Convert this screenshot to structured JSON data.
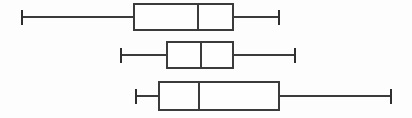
{
  "figure": {
    "background_color": "#fdfdfd",
    "line_color": "#3b3b3b",
    "box_fill_color": "#fefefe",
    "width": 412,
    "height": 118
  },
  "chart_data": {
    "type": "box",
    "orientation": "horizontal",
    "title": "",
    "subtitle": "",
    "xlabel": "",
    "ylabel": "",
    "xlim": [
      0,
      412
    ],
    "ylim": [
      0,
      3
    ],
    "grid": false,
    "legend": null,
    "axes_visible": false,
    "tick_labels": [],
    "categories": [
      "Series 1",
      "Series 2",
      "Series 3"
    ],
    "boxes": [
      {
        "name": "Series 1",
        "row": 1,
        "whisker_low": 22,
        "q1": 134,
        "median": 198,
        "q3": 233,
        "whisker_high": 279,
        "center_y": 17,
        "box_top": 4,
        "box_bottom": 30,
        "cap_top": 10,
        "cap_bottom": 25,
        "outliers": []
      },
      {
        "name": "Series 2",
        "row": 2,
        "whisker_low": 121,
        "q1": 167,
        "median": 201,
        "q3": 233,
        "whisker_high": 295,
        "center_y": 55,
        "box_top": 42,
        "box_bottom": 68,
        "cap_top": 48,
        "cap_bottom": 63,
        "outliers": []
      },
      {
        "name": "Series 3",
        "row": 3,
        "whisker_low": 136,
        "q1": 159,
        "median": 199,
        "q3": 279,
        "whisker_high": 391,
        "center_y": 96,
        "box_top": 82,
        "box_bottom": 110,
        "cap_top": 89,
        "cap_bottom": 104,
        "outliers": []
      }
    ]
  }
}
